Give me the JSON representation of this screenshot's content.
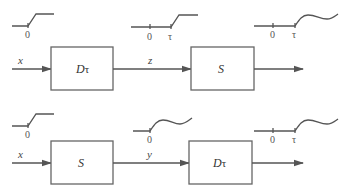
{
  "diagram": {
    "top_row": {
      "input_label": "x",
      "first_block": {
        "label": "D",
        "subscript": "τ"
      },
      "intermediate_label": "z",
      "second_block": {
        "label": "S",
        "subscript": ""
      },
      "input_signal": {
        "shape": "ramp-step",
        "ticks": [
          "0"
        ]
      },
      "intermediate_signal": {
        "shape": "delayed-ramp-step",
        "ticks": [
          "0",
          "τ"
        ]
      },
      "output_signal": {
        "shape": "delayed-wavy-response",
        "ticks": [
          "0",
          "τ"
        ]
      }
    },
    "bottom_row": {
      "input_label": "x",
      "first_block": {
        "label": "S",
        "subscript": ""
      },
      "intermediate_label": "y",
      "second_block": {
        "label": "D",
        "subscript": "τ"
      },
      "input_signal": {
        "shape": "ramp-step",
        "ticks": [
          "0"
        ]
      },
      "intermediate_signal": {
        "shape": "wavy-response",
        "ticks": [
          "0"
        ]
      },
      "output_signal": {
        "shape": "delayed-wavy-response",
        "ticks": [
          "0",
          "τ"
        ]
      }
    },
    "colors": {
      "line": "#555555",
      "box_border": "#666666",
      "background": "#ffffff"
    }
  }
}
